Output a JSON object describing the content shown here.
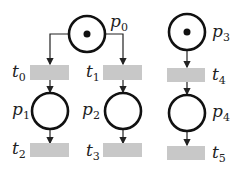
{
  "diagram": {
    "type": "petri-net",
    "colors": {
      "place_stroke": "#111111",
      "transition_fill": "#c8c8c8",
      "arc": "#222222",
      "token": "#111111"
    },
    "places": [
      {
        "id": "p0",
        "base": "p",
        "sub": "0",
        "tokens": 1
      },
      {
        "id": "p1",
        "base": "p",
        "sub": "1",
        "tokens": 0
      },
      {
        "id": "p2",
        "base": "p",
        "sub": "2",
        "tokens": 0
      },
      {
        "id": "p3",
        "base": "p",
        "sub": "3",
        "tokens": 1
      },
      {
        "id": "p4",
        "base": "p",
        "sub": "4",
        "tokens": 0
      }
    ],
    "transitions": [
      {
        "id": "t0",
        "base": "t",
        "sub": "0"
      },
      {
        "id": "t1",
        "base": "t",
        "sub": "1"
      },
      {
        "id": "t2",
        "base": "t",
        "sub": "2"
      },
      {
        "id": "t3",
        "base": "t",
        "sub": "3"
      },
      {
        "id": "t4",
        "base": "t",
        "sub": "4"
      },
      {
        "id": "t5",
        "base": "t",
        "sub": "5"
      }
    ],
    "arcs": [
      [
        "p0",
        "t0"
      ],
      [
        "p0",
        "t1"
      ],
      [
        "t0",
        "p1"
      ],
      [
        "t1",
        "p2"
      ],
      [
        "p1",
        "t2"
      ],
      [
        "p2",
        "t3"
      ],
      [
        "p3",
        "t4"
      ],
      [
        "t4",
        "p4"
      ],
      [
        "p4",
        "t5"
      ]
    ]
  }
}
